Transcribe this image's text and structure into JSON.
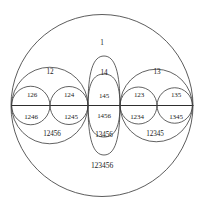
{
  "diagram": {
    "kind": "venn-diagram",
    "title": "123456",
    "universe_label": "1",
    "stroke_color": "#3a3a3a",
    "background_color": "#ffffff",
    "text_color": "#1b1b1b",
    "regions": [
      {
        "id": "r-top",
        "label": "1",
        "x": 102,
        "y": 44,
        "size": "m"
      },
      {
        "id": "r-left-top",
        "label": "12",
        "x": 50,
        "y": 73,
        "size": "m"
      },
      {
        "id": "r-mid-top",
        "label": "14",
        "x": 104,
        "y": 74,
        "size": "m"
      },
      {
        "id": "r-right-top",
        "label": "13",
        "x": 157,
        "y": 73,
        "size": "m"
      },
      {
        "id": "r-c1-upper",
        "label": "126",
        "x": 32,
        "y": 95,
        "size": "s"
      },
      {
        "id": "r-c2-upper",
        "label": "124",
        "x": 69,
        "y": 95,
        "size": "s"
      },
      {
        "id": "r-c3-upper",
        "label": "145",
        "x": 104,
        "y": 96,
        "size": "s"
      },
      {
        "id": "r-c4-upper",
        "label": "123",
        "x": 139,
        "y": 95,
        "size": "s"
      },
      {
        "id": "r-c5-upper",
        "label": "135",
        "x": 176,
        "y": 95,
        "size": "s"
      },
      {
        "id": "r-c1-lower",
        "label": "1246",
        "x": 31,
        "y": 117,
        "size": "s"
      },
      {
        "id": "r-c2-lower",
        "label": "1245",
        "x": 71,
        "y": 117,
        "size": "s"
      },
      {
        "id": "r-c3-lower",
        "label": "1456",
        "x": 104,
        "y": 116,
        "size": "s"
      },
      {
        "id": "r-c4-lower",
        "label": "1234",
        "x": 137,
        "y": 117,
        "size": "s"
      },
      {
        "id": "r-c5-lower",
        "label": "1345",
        "x": 176,
        "y": 117,
        "size": "s"
      },
      {
        "id": "r-left-bot",
        "label": "12456",
        "x": 52,
        "y": 135,
        "size": "m"
      },
      {
        "id": "r-mid-bot",
        "label": "13456",
        "x": 104,
        "y": 136,
        "size": "m"
      },
      {
        "id": "r-right-bot",
        "label": "12345",
        "x": 155,
        "y": 135,
        "size": "m"
      },
      {
        "id": "r-bottom",
        "label": "123456",
        "x": 102,
        "y": 166,
        "size": "l"
      }
    ]
  }
}
